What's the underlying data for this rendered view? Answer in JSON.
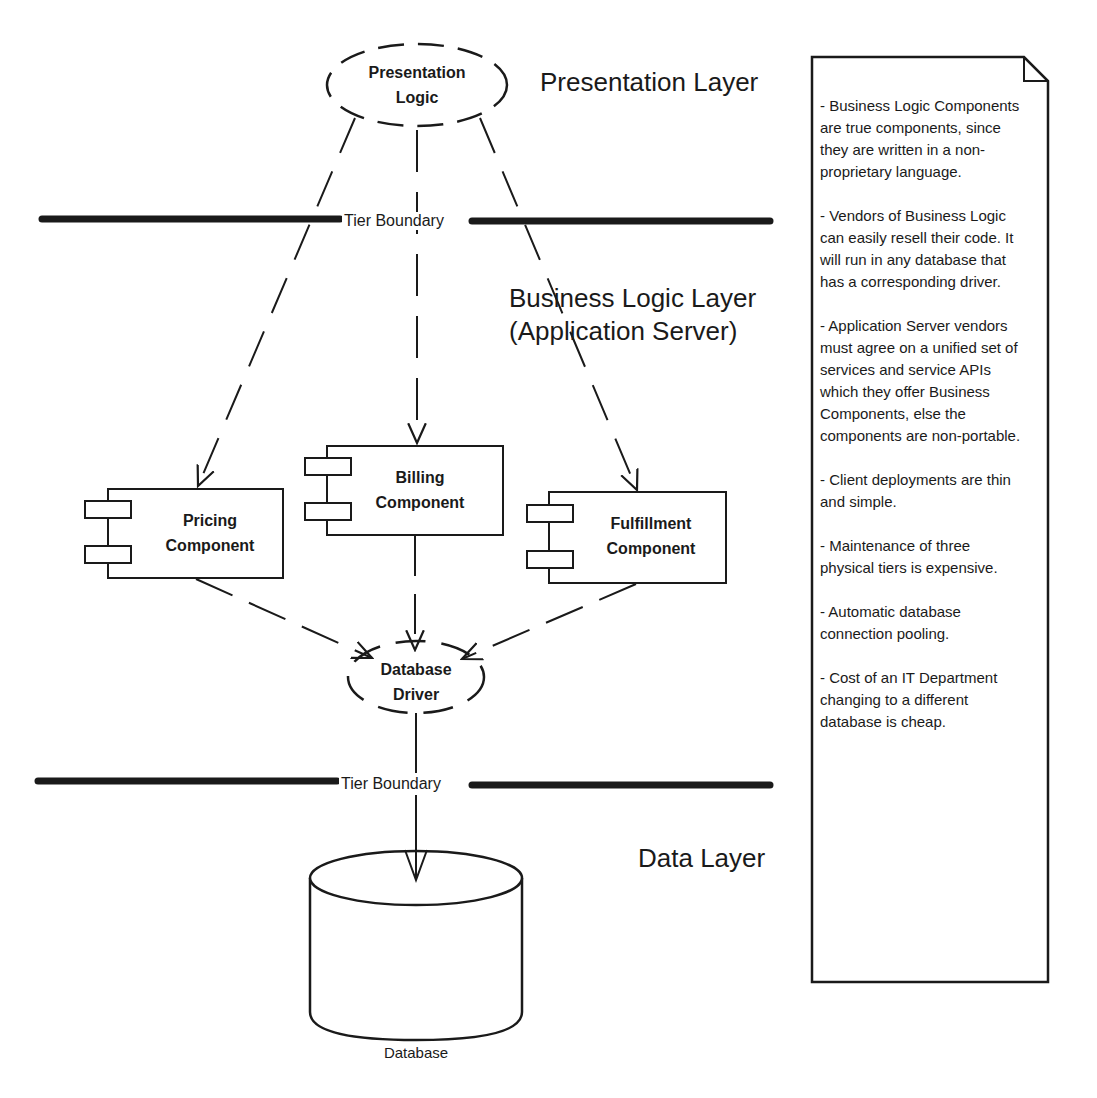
{
  "layers": {
    "presentation": "Presentation Layer",
    "business_line1": "Business Logic Layer",
    "business_line2": "(Application Server)",
    "data": "Data Layer"
  },
  "tier_boundaries": [
    {
      "label": "Tier Boundary"
    },
    {
      "label": "Tier Boundary"
    }
  ],
  "nodes": {
    "presentation_logic": {
      "line1": "Presentation",
      "line2": "Logic"
    },
    "pricing": {
      "line1": "Pricing",
      "line2": "Component"
    },
    "billing": {
      "line1": "Billing",
      "line2": "Component"
    },
    "fulfillment": {
      "line1": "Fulfillment",
      "line2": "Component"
    },
    "database_driver": {
      "line1": "Database",
      "line2": "Driver"
    },
    "database": {
      "label": "Database"
    }
  },
  "note": {
    "items": [
      "- Business Logic Components are  true components, since they are written in a non-proprietary language.",
      "- Vendors of Business Logic can easily resell their code.  It will run in any database that has a corresponding driver.",
      "- Application Server vendors must agree on a unified set of services and service APIs which they offer Business Components, else the components are non-portable.",
      "- Client deployments are thin and simple.",
      "- Maintenance of three physical tiers is expensive.",
      "- Automatic database connection pooling.",
      "- Cost of an IT Department changing to a different database is cheap."
    ]
  },
  "colors": {
    "ink": "#1a1a1a",
    "background": "#ffffff"
  }
}
